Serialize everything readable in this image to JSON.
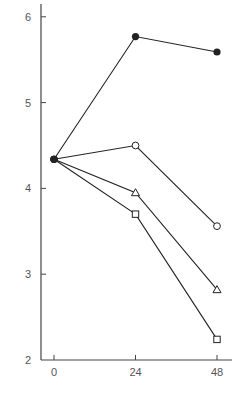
{
  "chart_data": {
    "type": "line",
    "title": "",
    "xlabel": "",
    "ylabel": "",
    "x": [
      0,
      24,
      48
    ],
    "xticks": [
      "0",
      "24",
      "48"
    ],
    "yticks": [
      "2",
      "3",
      "4",
      "5",
      "6"
    ],
    "xlim": [
      0,
      48
    ],
    "ylim": [
      2,
      6.15
    ],
    "grid": false,
    "legend": "none",
    "series": [
      {
        "name": "filled-circle",
        "marker": "filled-circle",
        "values": [
          4.34,
          5.77,
          5.59
        ]
      },
      {
        "name": "open-circle",
        "marker": "open-circle",
        "values": [
          4.34,
          4.5,
          3.56
        ]
      },
      {
        "name": "open-triangle",
        "marker": "open-triangle",
        "values": [
          4.34,
          3.95,
          2.82
        ]
      },
      {
        "name": "open-square",
        "marker": "open-square",
        "values": [
          4.34,
          3.7,
          2.24
        ]
      }
    ]
  },
  "colors": {
    "line": "#222222",
    "axis": "#444444",
    "text": "#555555"
  }
}
